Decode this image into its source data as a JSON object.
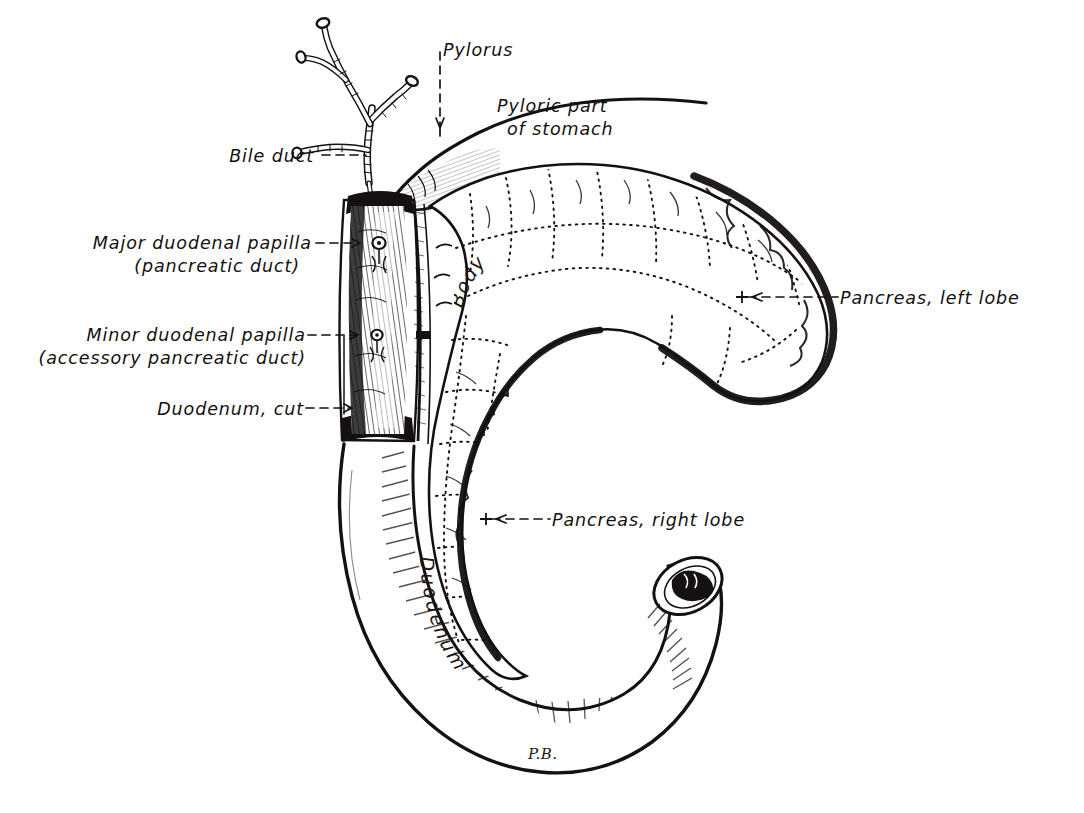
{
  "figure": {
    "signature": "P.B.",
    "background_color": "#ffffff",
    "ink_color": "#141110"
  },
  "labels": {
    "pylorus": {
      "text": "Pylorus",
      "leader": "dashed-arrow-down"
    },
    "pyloric_part_of_stomach": {
      "line1": "Pyloric part",
      "line2": "of stomach",
      "leader": "none"
    },
    "bile_duct": {
      "text": "Bile duct",
      "leader": "dashed-line-right"
    },
    "major_duodenal_papilla": {
      "line1": "Major duodenal papilla",
      "line2": "(pancreatic duct)",
      "leader": "dashed-line-right"
    },
    "minor_duodenal_papilla": {
      "line1": "Minor duodenal papilla",
      "line2": "(accessory pancreatic duct)",
      "leader": "dashed-line-right"
    },
    "duodenum_cut": {
      "text": "Duodenum, cut",
      "leader": "dashed-arrow-right"
    },
    "pancreas_left_lobe": {
      "text": "Pancreas, left lobe",
      "leader": "dashed-line-left-with-cross"
    },
    "pancreas_right_lobe": {
      "text": "Pancreas, right lobe",
      "leader": "dashed-line-left-with-cross"
    },
    "body": {
      "text": "Body",
      "leader": "none"
    },
    "duodenum": {
      "text": "Duodenum",
      "leader": "none"
    }
  },
  "structures": [
    {
      "name": "pyloric-part-of-stomach",
      "type": "organ-outline"
    },
    {
      "name": "pylorus",
      "type": "landmark"
    },
    {
      "name": "bile-duct-tree",
      "type": "duct"
    },
    {
      "name": "duodenum-cut-open",
      "type": "organ-sectioned"
    },
    {
      "name": "duodenum-loop",
      "type": "organ-outline"
    },
    {
      "name": "pancreas-left-lobe",
      "type": "organ-lobulated"
    },
    {
      "name": "pancreas-right-lobe",
      "type": "organ-lobulated"
    },
    {
      "name": "pancreas-body",
      "type": "organ-lobulated"
    },
    {
      "name": "major-duodenal-papilla",
      "type": "papilla"
    },
    {
      "name": "minor-duodenal-papilla",
      "type": "papilla"
    },
    {
      "name": "duodenum-distal-cut-end",
      "type": "cut-surface"
    }
  ]
}
